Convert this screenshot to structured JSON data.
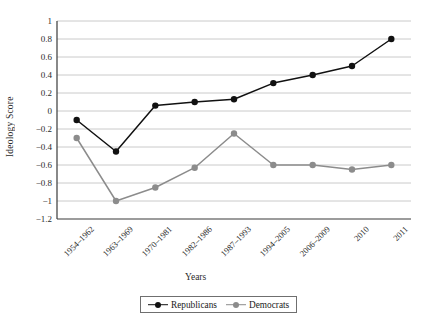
{
  "chart_data": {
    "type": "line",
    "title": "",
    "xlabel": "Years",
    "ylabel": "Ideology Score",
    "categories": [
      "1954–1962",
      "1963–1969",
      "1970–1981",
      "1982–1986",
      "1987–1993",
      "1994–2005",
      "2006–2009",
      "2010",
      "2011"
    ],
    "series": [
      {
        "name": "Republicans",
        "color": "#111111",
        "values": [
          -0.1,
          -0.45,
          0.06,
          0.1,
          0.13,
          0.31,
          0.4,
          0.5,
          0.8
        ]
      },
      {
        "name": "Democrats",
        "color": "#8c8c8c",
        "values": [
          -0.3,
          -1.0,
          -0.85,
          -0.63,
          -0.25,
          -0.6,
          -0.6,
          -0.65,
          -0.6
        ]
      }
    ],
    "ylim": [
      -1.2,
      1.0
    ],
    "yticks": [
      1,
      0.8,
      0.6,
      0.4,
      0.2,
      0,
      -0.2,
      -0.4,
      -0.6,
      -0.8,
      -1,
      -1.2
    ],
    "ytick_labels": [
      "1",
      "0.8",
      "0.6",
      "0.4",
      "0.2",
      "0",
      "−0.2",
      "−0.4",
      "−0.6",
      "−0.8",
      "−1",
      "−1.2"
    ],
    "grid": true,
    "legend_position": "bottom-center",
    "marker": "circle"
  }
}
